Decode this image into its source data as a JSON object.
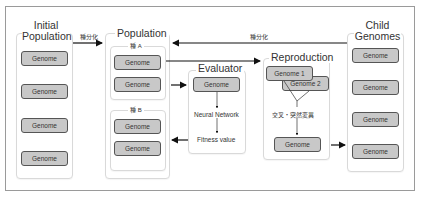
{
  "diagram": {
    "initial_population": {
      "title_line1": "Initial",
      "title_line2": "Population",
      "genomes": [
        "Genome",
        "Genome",
        "Genome",
        "Genome"
      ]
    },
    "population": {
      "title": "Population",
      "species_a": {
        "title": "種 A",
        "genomes": [
          "Genome",
          "Genome"
        ]
      },
      "species_b": {
        "title": "種 B",
        "genomes": [
          "Genome",
          "Genome"
        ]
      }
    },
    "evaluator": {
      "title": "Evaluator",
      "genome": "Genome",
      "step1": "Neural Network",
      "step2": "Fitness value"
    },
    "reproduction": {
      "title": "Reproduction",
      "parent1": "Genome 1",
      "parent2": "Genome 2",
      "operation": "交叉・突然変異",
      "child": "Genome"
    },
    "child_genomes": {
      "title_line1": "Child",
      "title_line2": "Genomes",
      "genomes": [
        "Genome",
        "Genome",
        "Genome",
        "Genome"
      ]
    },
    "edges": {
      "speciation_1": "種分化",
      "speciation_2": "種分化"
    }
  }
}
